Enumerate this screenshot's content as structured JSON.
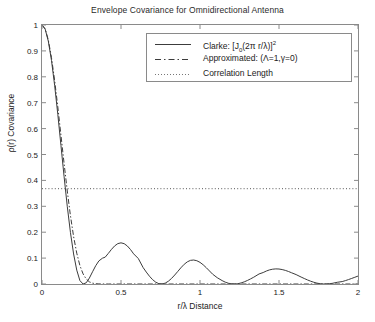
{
  "chart_data": {
    "type": "line",
    "title": "Envelope Covariance for Omnidirectional Antenna",
    "xlabel": "r/λ  Distance",
    "ylabel": "ρ(r) Covariance",
    "xlim": [
      0,
      2
    ],
    "ylim": [
      0,
      1
    ],
    "grid": false,
    "legend_position": "top-right-inside",
    "xticks": [
      "0",
      "0.5",
      "1",
      "1.5",
      "2"
    ],
    "xtick_values": [
      0,
      0.5,
      1,
      1.5,
      2
    ],
    "yticks": [
      "0",
      "0.1",
      "0.2",
      "0.3",
      "0.4",
      "0.5",
      "0.6",
      "0.7",
      "0.8",
      "0.9",
      "1"
    ],
    "ytick_values": [
      0,
      0.1,
      0.2,
      0.3,
      0.4,
      0.5,
      0.6,
      0.7,
      0.8,
      0.9,
      1
    ],
    "series": [
      {
        "name": "clarke",
        "legend_label": "Clarke: [J0(2π r/λ)]2",
        "style": "solid",
        "color": "#3c3c3c",
        "x": [
          0,
          0.02,
          0.04,
          0.06,
          0.08,
          0.1,
          0.12,
          0.14,
          0.16,
          0.18,
          0.2,
          0.22,
          0.24,
          0.26,
          0.28,
          0.3,
          0.32,
          0.34,
          0.36,
          0.3827,
          0.4,
          0.42,
          0.44,
          0.46,
          0.48,
          0.5,
          0.52,
          0.54,
          0.56,
          0.58,
          0.6096,
          0.64,
          0.66,
          0.68,
          0.7,
          0.72,
          0.74,
          0.76,
          0.78,
          0.8,
          0.82,
          0.84,
          0.86,
          0.8784,
          0.9,
          0.92,
          0.94,
          0.96,
          0.98,
          1.0,
          1.02,
          1.04,
          1.06,
          1.08,
          1.1092,
          1.14,
          1.16,
          1.18,
          1.2,
          1.22,
          1.24,
          1.26,
          1.28,
          1.3,
          1.32,
          1.34,
          1.3736,
          1.4,
          1.42,
          1.44,
          1.46,
          1.48,
          1.5,
          1.52,
          1.54,
          1.56,
          1.58,
          1.6084,
          1.64,
          1.66,
          1.68,
          1.7,
          1.72,
          1.74,
          1.76,
          1.78,
          1.8,
          1.82,
          1.84,
          1.8688,
          1.9,
          1.92,
          1.94,
          1.96,
          1.98,
          2.0
        ],
        "y": [
          1.0,
          0.9842,
          0.9376,
          0.8636,
          0.7672,
          0.6551,
          0.5347,
          0.4138,
          0.2998,
          0.1989,
          0.1159,
          0.0535,
          0.0131,
          0.0,
          0.0047,
          0.0231,
          0.0472,
          0.0707,
          0.0892,
          0.0997,
          0.1036,
          0.1184,
          0.1339,
          0.1472,
          0.1559,
          0.1589,
          0.1557,
          0.1468,
          0.1332,
          0.1164,
          0.0983,
          0.0635,
          0.0461,
          0.0301,
          0.0168,
          0.0069,
          0.0012,
          0.0,
          0.0034,
          0.0108,
          0.0216,
          0.0347,
          0.0489,
          0.0622,
          0.0761,
          0.0857,
          0.0913,
          0.0926,
          0.0899,
          0.0835,
          0.0742,
          0.0628,
          0.0504,
          0.0379,
          0.0243,
          0.0132,
          0.0071,
          0.0029,
          0.0006,
          0.0,
          0.0012,
          0.0041,
          0.0083,
          0.0136,
          0.0197,
          0.0262,
          0.0387,
          0.0443,
          0.0501,
          0.0545,
          0.0572,
          0.0583,
          0.0578,
          0.0558,
          0.0526,
          0.0483,
          0.0433,
          0.0363,
          0.0268,
          0.0212,
          0.0158,
          0.0109,
          0.0067,
          0.0034,
          0.0012,
          0.0001,
          0.0001,
          0.0011,
          0.0029,
          0.0066,
          0.0094,
          0.013,
          0.0171,
          0.0215,
          0.026,
          0.0306
        ]
      },
      {
        "name": "approximated",
        "legend_label": "Approximated: (Λ=1,γ=0)",
        "style": "dashdot",
        "color": "#3c3c3c",
        "x": [
          0,
          0.02,
          0.04,
          0.06,
          0.08,
          0.1,
          0.12,
          0.14,
          0.16,
          0.18,
          0.2,
          0.22,
          0.24,
          0.26,
          0.28,
          0.3,
          0.32,
          0.34,
          0.36,
          0.38,
          0.4,
          0.42,
          0.44,
          0.46,
          0.5,
          0.6,
          0.8,
          1.0,
          1.5,
          2.0
        ],
        "y": [
          1.0,
          0.985,
          0.942,
          0.874,
          0.786,
          0.684,
          0.574,
          0.464,
          0.359,
          0.264,
          0.183,
          0.119,
          0.071,
          0.039,
          0.019,
          0.0083,
          0.0032,
          0.0011,
          0.00035,
          0.0001,
          3e-05,
          1e-05,
          0.0,
          0.0,
          0.0,
          0.0,
          0.0,
          0.0,
          0.0,
          0.0
        ]
      },
      {
        "name": "correlation-length",
        "legend_label": "Correlation Length",
        "style": "dotted",
        "color": "#555555",
        "constant_y": 0.368,
        "x": [
          0,
          2
        ],
        "y": [
          0.368,
          0.368
        ]
      }
    ]
  },
  "legend": {
    "entries": [
      {
        "label_main": "Clarke: [J",
        "sub": "0",
        "label_mid": "(2π r/λ)]",
        "sup": "2"
      },
      {
        "label": "Approximated: (Λ=1,γ=0)"
      },
      {
        "label": "Correlation Length"
      }
    ]
  },
  "axis": {
    "title": "Envelope Covariance for Omnidirectional Antenna",
    "xlabel": "r/λ  Distance",
    "ylabel": "ρ(r) Covariance"
  },
  "colors": {
    "line": "#3c3c3c",
    "axis": "#8a8a8a",
    "text": "#222222",
    "background": "#ffffff"
  }
}
